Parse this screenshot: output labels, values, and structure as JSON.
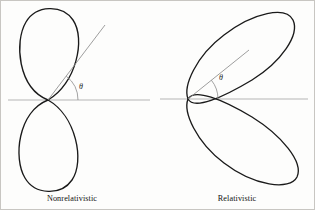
{
  "figure": {
    "title": "",
    "background_color": "#fdfdfc",
    "curve_color": "#1a1a1a",
    "axis_color": "#b5b5b5",
    "ray_color": "#8c8c8c"
  },
  "panels": [
    {
      "id": "nonrelativistic",
      "caption": "Nonrelativistic",
      "angle_label": "θ",
      "origin": {
        "x": 48,
        "y": 100
      },
      "axis": {
        "x1": 8,
        "y1": 100,
        "x2": 150,
        "y2": 100
      },
      "ray": {
        "x1": 48,
        "y1": 100,
        "x2": 105,
        "y2": 25
      },
      "arc_radius": 30,
      "theta_text_pos": {
        "x": 79,
        "y": 89
      },
      "caption_pos": {
        "x": 72,
        "y": 201
      },
      "lobes": [
        {
          "name": "upper-lobe",
          "path": "M48,100 C18,88 14,42 26,22 C36,5 62,4 73,20 C86,39 76,84 48,100 Z"
        },
        {
          "name": "lower-lobe",
          "path": "M48,100 C18,112 13,158 25,178 C35,195 61,196 72,180 C85,161 76,116 48,100 Z"
        }
      ]
    },
    {
      "id": "relativistic",
      "caption": "Relativistic",
      "angle_label": "θ",
      "origin": {
        "x": 188,
        "y": 99
      },
      "axis": {
        "x1": 160,
        "y1": 99,
        "x2": 308,
        "y2": 99
      },
      "ray": {
        "x1": 188,
        "y1": 99,
        "x2": 249,
        "y2": 50
      },
      "arc_radius": 30,
      "theta_text_pos": {
        "x": 219,
        "y": 80
      },
      "caption_pos": {
        "x": 237,
        "y": 201
      },
      "lobes": [
        {
          "name": "upper-lobe",
          "path": "M188,99 C183,86 196,56 224,35 C254,12 286,6 293,20 C300,35 281,62 252,80 C222,98 194,110 188,99 Z"
        },
        {
          "name": "lower-lobe",
          "path": "M188,99 C183,112 196,142 224,163 C254,186 290,191 297,177 C304,162 281,135 252,117 C222,99 194,88 188,99 Z"
        }
      ]
    }
  ]
}
